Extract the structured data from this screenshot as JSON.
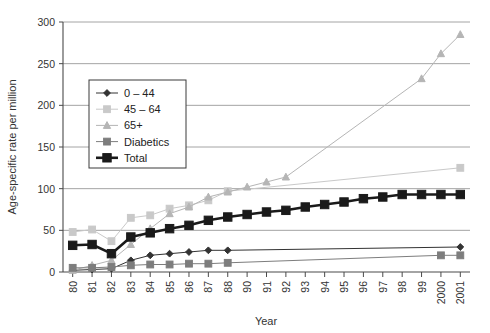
{
  "chart_data": {
    "type": "line",
    "title": "",
    "xlabel": "Year",
    "ylabel": "Age-specific rate per million",
    "ylim": [
      0,
      300
    ],
    "yticks": [
      0,
      50,
      100,
      150,
      200,
      250,
      300
    ],
    "grid": true,
    "legend_position": "inside-upper-left",
    "categories": [
      "80",
      "81",
      "82",
      "83",
      "84",
      "85",
      "86",
      "87",
      "88",
      "90",
      "91",
      "92",
      "93",
      "94",
      "95",
      "96",
      "97",
      "98",
      "99",
      "2000",
      "2001"
    ],
    "series": [
      {
        "name": "0 – 44",
        "marker": "diamond",
        "color": "#333333",
        "values": [
          2,
          3,
          4,
          14,
          20,
          22,
          24,
          26,
          26,
          null,
          null,
          null,
          null,
          null,
          null,
          null,
          null,
          null,
          null,
          null,
          30
        ]
      },
      {
        "name": "45 – 64",
        "marker": "square",
        "color": "#c9c9c9",
        "values": [
          48,
          51,
          37,
          65,
          68,
          76,
          80,
          86,
          97,
          null,
          null,
          null,
          null,
          null,
          null,
          null,
          null,
          null,
          null,
          null,
          125
        ]
      },
      {
        "name": "65+",
        "marker": "triangle",
        "color": "#b5b5b5",
        "values": [
          2,
          8,
          14,
          33,
          52,
          70,
          78,
          90,
          96,
          102,
          108,
          114,
          null,
          null,
          null,
          null,
          null,
          null,
          232,
          262,
          285
        ]
      },
      {
        "name": "Diabetics",
        "marker": "square",
        "color": "#7d7d7d",
        "values": [
          5,
          5,
          6,
          8,
          9,
          9,
          10,
          10,
          11,
          null,
          null,
          null,
          null,
          null,
          null,
          null,
          null,
          null,
          null,
          20,
          20
        ]
      },
      {
        "name": "Total",
        "marker": "square-bold",
        "color": "#1a1a1a",
        "values": [
          32,
          33,
          22,
          42,
          47,
          52,
          56,
          62,
          66,
          69,
          72,
          74,
          78,
          81,
          84,
          88,
          90,
          93,
          93,
          93,
          93
        ]
      }
    ]
  },
  "axis": {
    "y_title": "Age-specific rate per million",
    "x_title": "Year",
    "y_tick_labels": [
      "0",
      "50",
      "100",
      "150",
      "200",
      "250",
      "300"
    ],
    "x_tick_labels": [
      "80",
      "81",
      "82",
      "83",
      "84",
      "85",
      "86",
      "87",
      "88",
      "90",
      "91",
      "92",
      "93",
      "94",
      "95",
      "96",
      "97",
      "98",
      "99",
      "2000",
      "2001"
    ]
  },
  "legend": {
    "items": [
      {
        "label": "0 – 44",
        "marker": "diamond-icon"
      },
      {
        "label": "45 – 64",
        "marker": "square-light-icon"
      },
      {
        "label": "65+",
        "marker": "triangle-icon"
      },
      {
        "label": "Diabetics",
        "marker": "square-gray-icon"
      },
      {
        "label": "Total",
        "marker": "square-bold-icon"
      }
    ]
  }
}
